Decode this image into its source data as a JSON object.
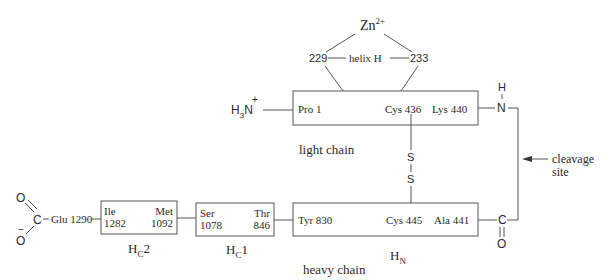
{
  "zinc": {
    "label": "Zn",
    "charge": "2+",
    "residue_left": "229",
    "residue_right": "233",
    "helix_label": "helix H"
  },
  "light_chain": {
    "n_terminus": {
      "atom": "N",
      "h": "H",
      "sub": "3",
      "charge": "+"
    },
    "start_residue": "Pro 1",
    "cys_residue": "Cys 436",
    "end_residue": "Lys 440",
    "label": "light chain",
    "amide": {
      "n": "N",
      "h": "H"
    }
  },
  "disulfide": {
    "s1": "S",
    "s2": "S"
  },
  "cleavage": {
    "line1": "cleavage",
    "line2": "site"
  },
  "heavy_chain": {
    "label": "heavy chain",
    "domains": [
      {
        "id": "HN",
        "label_main": "H",
        "label_sub": "N",
        "left_residue": "Tyr 830",
        "cys_residue": "Cys 445",
        "right_residue": "Ala 441"
      },
      {
        "id": "HC1",
        "label_main": "H",
        "label_sub": "C",
        "label_suffix": "1",
        "left_top": "Ser",
        "left_bottom": "1078",
        "right_top": "Thr",
        "right_bottom": "846"
      },
      {
        "id": "HC2",
        "label_main": "H",
        "label_sub": "C",
        "label_suffix": "2",
        "left_top": "Ile",
        "left_bottom": "1282",
        "right_top": "Met",
        "right_bottom": "1092"
      }
    ],
    "c_terminus": {
      "residue": "Glu 1290",
      "carbon": "C",
      "oxygen_top": "O",
      "oxygen_bottom": "O",
      "charge": "−"
    },
    "carbonyl": {
      "c": "C",
      "o": "O"
    }
  }
}
